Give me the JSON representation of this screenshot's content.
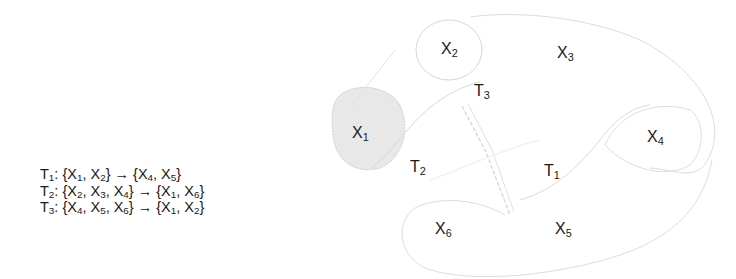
{
  "rules": [
    {
      "name": "T",
      "idx": "1",
      "lhs": [
        [
          "X",
          "1"
        ],
        [
          "X",
          "2"
        ]
      ],
      "rhs": [
        [
          "X",
          "4"
        ],
        [
          "X",
          "5"
        ]
      ],
      "text": "T1: {X1, X2} → {X4, X5}"
    },
    {
      "name": "T",
      "idx": "2",
      "lhs": [
        [
          "X",
          "2"
        ],
        [
          "X",
          "3"
        ],
        [
          "X",
          "4"
        ]
      ],
      "rhs": [
        [
          "X",
          "1"
        ],
        [
          "X",
          "6"
        ]
      ],
      "text": "T2: {X2, X3, X4} → {X1, X6}"
    },
    {
      "name": "T",
      "idx": "3",
      "lhs": [
        [
          "X",
          "4"
        ],
        [
          "X",
          "5"
        ],
        [
          "X",
          "6"
        ]
      ],
      "rhs": [
        [
          "X",
          "1"
        ],
        [
          "X",
          "2"
        ]
      ],
      "text": "T3: {X4, X5, X6} → {X1, X2}"
    }
  ],
  "diagram": {
    "nodes": [
      {
        "id": "X1",
        "base": "X",
        "sub": "1",
        "x": 352,
        "y": 124,
        "highlighted": true
      },
      {
        "id": "X2",
        "base": "X",
        "sub": "2",
        "x": 441,
        "y": 40
      },
      {
        "id": "X3",
        "base": "X",
        "sub": "3",
        "x": 557,
        "y": 44
      },
      {
        "id": "X4",
        "base": "X",
        "sub": "4",
        "x": 647,
        "y": 128
      },
      {
        "id": "X5",
        "base": "X",
        "sub": "5",
        "x": 555,
        "y": 220
      },
      {
        "id": "X6",
        "base": "X",
        "sub": "6",
        "x": 435,
        "y": 220
      }
    ],
    "transitions": [
      {
        "id": "T1",
        "base": "T",
        "sub": "1",
        "x": 544,
        "y": 162
      },
      {
        "id": "T2",
        "base": "T",
        "sub": "2",
        "x": 410,
        "y": 158
      },
      {
        "id": "T3",
        "base": "T",
        "sub": "3",
        "x": 474,
        "y": 82
      }
    ],
    "colors": {
      "stroke": "#d4d4d4",
      "highlight_fill": "#e6e6e6",
      "text": "#1a1a1a"
    }
  }
}
